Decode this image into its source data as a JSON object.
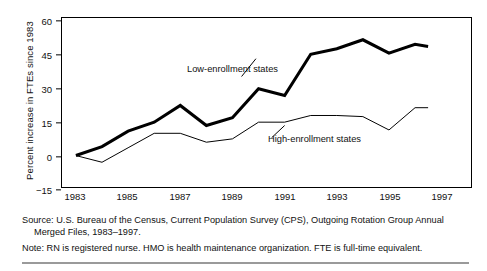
{
  "chart_data": {
    "type": "line",
    "title": "",
    "xlabel": "",
    "ylabel": "Percent increase in FTEs since 1983",
    "xlim": [
      1983,
      1997
    ],
    "ylim": [
      -15,
      60
    ],
    "xticks": [
      1983,
      1985,
      1987,
      1989,
      1991,
      1993,
      1995,
      1997
    ],
    "yticks": [
      -15,
      0,
      15,
      30,
      45,
      60
    ],
    "grid": false,
    "legend_position": "inline-annotations",
    "x": [
      1983,
      1984,
      1985,
      1986,
      1987,
      1988,
      1989,
      1990,
      1991,
      1992,
      1993,
      1994,
      1995,
      1996,
      1996.5
    ],
    "series": [
      {
        "name": "Low-enrollment states",
        "style": "thick",
        "color": "#000000",
        "values": [
          0,
          4,
          11,
          15,
          22.5,
          13.5,
          17,
          30,
          27,
          45.5,
          48,
          52,
          46,
          50,
          49
        ]
      },
      {
        "name": "High-enrollment states",
        "style": "thin",
        "color": "#000000",
        "values": [
          0,
          -3,
          3.5,
          10,
          10,
          6,
          7.5,
          15,
          15,
          18,
          18,
          17.5,
          11.5,
          21.5,
          21.5
        ]
      }
    ],
    "annotations": [
      {
        "text": "Low-enrollment states",
        "series": "Low-enrollment states"
      },
      {
        "text": "High-enrollment states",
        "series": "High-enrollment states"
      }
    ]
  },
  "axis": {
    "y_title": "Percent increase in FTEs since 1983",
    "y_tick_labels": [
      "60",
      "45",
      "30",
      "15",
      "0",
      "−15"
    ],
    "x_tick_labels": [
      "1983",
      "1985",
      "1987",
      "1989",
      "1991",
      "1993",
      "1995",
      "1997"
    ]
  },
  "annotations": {
    "low": "Low-enrollment states",
    "high": "High-enrollment states"
  },
  "footnotes": {
    "source_line1": "Source: U.S. Bureau of the Census, Current Population Survey (CPS), Outgoing Rotation Group Annual",
    "source_line2": "Merged Files, 1983–1997.",
    "note": "Note: RN is registered nurse. HMO is health maintenance organization. FTE is full-time equivalent."
  }
}
